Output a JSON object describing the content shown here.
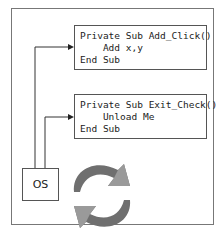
{
  "diagram": {
    "code_blocks": [
      {
        "lines": [
          "Private Sub Add_Click()",
          "    Add x,y",
          "End Sub"
        ]
      },
      {
        "lines": [
          "Private Sub Exit_Check()",
          "    Unload Me",
          "End Sub"
        ]
      }
    ],
    "os_label": "OS",
    "icons": [
      "cycle-arrows-icon"
    ]
  }
}
